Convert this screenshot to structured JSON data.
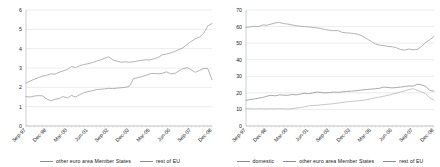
{
  "chart_data": [
    {
      "type": "line",
      "title": "",
      "xlabel": "",
      "ylabel": "",
      "ylim": [
        0,
        6
      ],
      "ytick_step": 1,
      "yticks": [
        "0",
        "1",
        "2",
        "3",
        "4",
        "5",
        "6"
      ],
      "grid": true,
      "legend_position": "bottom",
      "x": [
        "Sep-97",
        "Dec-97",
        "Mar-98",
        "Jun-98",
        "Sep-98",
        "Dec-98",
        "Mar-99",
        "Jun-99",
        "Sep-99",
        "Dec-99",
        "Mar-00",
        "Jun-00",
        "Sep-00",
        "Dec-00",
        "Mar-01",
        "Jun-01",
        "Sep-01",
        "Dec-01",
        "Mar-02",
        "Jun-02",
        "Sep-02",
        "Dec-02",
        "Mar-03",
        "Jun-03",
        "Sep-03",
        "Dec-03",
        "Mar-04",
        "Jun-04",
        "Sep-04",
        "Dec-04",
        "Mar-05",
        "Jun-05",
        "Sep-05",
        "Dec-05",
        "Mar-06",
        "Jun-06",
        "Sep-06",
        "Dec-06",
        "Mar-07",
        "Jun-07",
        "Sep-07",
        "Dec-07",
        "Mar-08",
        "Jun-08",
        "Sep-08",
        "Dec-08"
      ],
      "xtick_labels": [
        "Sep-97",
        "Dec-98",
        "Mar-00",
        "Jun-01",
        "Sep-02",
        "Dec-03",
        "Mar-05",
        "Jun-06",
        "Sep-07",
        "Dec-08"
      ],
      "xtick_indices": [
        0,
        5,
        10,
        15,
        20,
        25,
        30,
        35,
        40,
        45
      ],
      "series": [
        {
          "name": "other euro area Member States",
          "color": "#9a9a9a",
          "values": [
            1.52,
            1.5,
            1.55,
            1.57,
            1.56,
            1.4,
            1.3,
            1.38,
            1.42,
            1.52,
            1.45,
            1.58,
            1.5,
            1.62,
            1.72,
            1.78,
            1.82,
            1.88,
            1.9,
            1.92,
            1.95,
            1.93,
            1.96,
            1.98,
            2.0,
            2.05,
            2.45,
            2.5,
            2.55,
            2.62,
            2.7,
            2.72,
            2.7,
            2.73,
            2.8,
            2.7,
            2.72,
            2.85,
            2.97,
            3.02,
            2.9,
            2.78,
            2.88,
            2.98,
            2.96,
            2.4
          ]
        },
        {
          "name": "rest of EU",
          "color": "#9a9a9a",
          "values": [
            2.22,
            2.32,
            2.42,
            2.5,
            2.58,
            2.62,
            2.7,
            2.68,
            2.78,
            2.85,
            2.92,
            3.08,
            3.02,
            3.12,
            3.18,
            3.22,
            3.28,
            3.35,
            3.42,
            3.5,
            3.58,
            3.42,
            3.35,
            3.3,
            3.32,
            3.3,
            3.32,
            3.36,
            3.4,
            3.42,
            3.42,
            3.48,
            3.55,
            3.68,
            3.72,
            3.78,
            3.86,
            3.95,
            4.05,
            4.22,
            4.38,
            4.52,
            4.6,
            4.8,
            5.18,
            5.3
          ]
        }
      ]
    },
    {
      "type": "line",
      "title": "",
      "xlabel": "",
      "ylabel": "",
      "ylim": [
        0,
        70
      ],
      "ytick_step": 10,
      "yticks": [
        "0",
        "10",
        "20",
        "30",
        "40",
        "50",
        "60",
        "70"
      ],
      "grid": true,
      "legend_position": "bottom",
      "x": [
        "Sep-97",
        "Dec-97",
        "Mar-98",
        "Jun-98",
        "Sep-98",
        "Dec-98",
        "Mar-99",
        "Jun-99",
        "Sep-99",
        "Dec-99",
        "Mar-00",
        "Jun-00",
        "Sep-00",
        "Dec-00",
        "Mar-01",
        "Jun-01",
        "Sep-01",
        "Dec-01",
        "Mar-02",
        "Jun-02",
        "Sep-02",
        "Dec-02",
        "Mar-03",
        "Jun-03",
        "Sep-03",
        "Dec-03",
        "Mar-04",
        "Jun-04",
        "Sep-04",
        "Dec-04",
        "Mar-05",
        "Jun-05",
        "Sep-05",
        "Dec-05",
        "Mar-06",
        "Jun-06",
        "Sep-06",
        "Dec-06",
        "Mar-07",
        "Jun-07",
        "Sep-07",
        "Dec-07",
        "Mar-08",
        "Jun-08",
        "Sep-08",
        "Dec-08"
      ],
      "xtick_labels": [
        "Sep-97",
        "Dec-98",
        "Mar-00",
        "Jun-01",
        "Sep-02",
        "Dec-03",
        "Mar-05",
        "Jun-06",
        "Sep-07",
        "Dec-08"
      ],
      "xtick_indices": [
        0,
        5,
        10,
        15,
        20,
        25,
        30,
        35,
        40,
        45
      ],
      "series": [
        {
          "name": "domestic",
          "color": "#9a9a9a",
          "values": [
            59.5,
            59.8,
            60.2,
            60.0,
            61.0,
            60.8,
            61.5,
            62.2,
            62.5,
            61.8,
            61.5,
            61.0,
            60.5,
            60.2,
            60.0,
            59.8,
            59.5,
            59.2,
            58.8,
            58.2,
            57.8,
            57.5,
            57.6,
            56.5,
            56.2,
            56.0,
            55.8,
            55.2,
            54.0,
            52.5,
            51.0,
            49.5,
            48.8,
            48.5,
            48.0,
            47.8,
            47.2,
            46.2,
            45.8,
            46.5,
            46.0,
            46.2,
            48.0,
            50.5,
            52.0,
            54.0
          ]
        },
        {
          "name": "other euro area Member States",
          "color": "#8c8c8c",
          "values": [
            15.5,
            16.0,
            16.3,
            16.8,
            17.2,
            18.0,
            18.5,
            18.2,
            18.8,
            18.6,
            18.5,
            19.0,
            18.8,
            19.2,
            19.8,
            19.5,
            20.0,
            20.5,
            20.2,
            20.0,
            20.2,
            20.5,
            20.3,
            20.6,
            20.8,
            21.0,
            21.2,
            21.5,
            21.8,
            22.0,
            22.3,
            22.5,
            22.8,
            23.5,
            23.2,
            23.0,
            23.2,
            23.5,
            23.8,
            24.2,
            24.0,
            25.2,
            24.8,
            24.0,
            21.5,
            21.0
          ]
        },
        {
          "name": "rest of EU",
          "color": "#b4b4b4",
          "values": [
            10.5,
            10.4,
            10.3,
            10.5,
            10.4,
            10.3,
            10.4,
            10.3,
            10.5,
            10.4,
            10.2,
            10.5,
            10.8,
            11.2,
            11.5,
            12.2,
            12.4,
            12.5,
            12.8,
            13.0,
            13.2,
            13.5,
            13.8,
            14.2,
            14.5,
            14.8,
            15.0,
            15.2,
            15.5,
            16.0,
            16.5,
            17.0,
            17.5,
            18.0,
            18.5,
            19.2,
            19.8,
            20.5,
            21.2,
            22.0,
            22.5,
            21.5,
            20.5,
            19.5,
            17.0,
            15.5
          ]
        }
      ]
    }
  ],
  "panels": [
    {
      "legend": [
        {
          "label": "other euro area Member States"
        },
        {
          "label": "rest of EU"
        }
      ]
    },
    {
      "legend": [
        {
          "label": "domestic"
        },
        {
          "label": "other euro area Member States"
        },
        {
          "label": "rest of EU"
        }
      ]
    }
  ]
}
